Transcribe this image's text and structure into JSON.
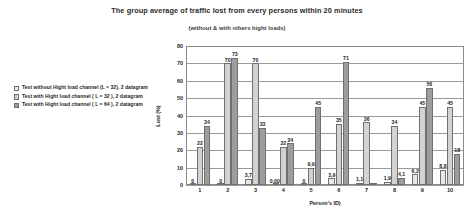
{
  "chart_data": {
    "type": "bar",
    "title": "The group average of traffic lost from every persons within 20 minutes",
    "subtitle": "(without & with others hight loads)",
    "xlabel": "Person's ID)",
    "ylabel": "Lost (%)",
    "ylim": [
      0,
      80
    ],
    "ytick_step": 10,
    "yticks": [
      0,
      10,
      20,
      30,
      40,
      50,
      60,
      70,
      80
    ],
    "grid": true,
    "legend_position": "left",
    "categories": [
      "1",
      "2",
      "3",
      "4",
      "5",
      "6",
      "7",
      "8",
      "9",
      "10"
    ],
    "series": [
      {
        "name": "Test without Hight load channel (L = 32), 2 datagram",
        "color": "#e8e8e8",
        "values": [
          0,
          0,
          3.7,
          0.001,
          0,
          3.9,
          1.1,
          1.9,
          6.2,
          8.8
        ],
        "labels": [
          "0",
          "0",
          "3,7",
          "0,001",
          "0",
          "3,9",
          "1,1",
          "1,9",
          "6,2",
          "8,8"
        ]
      },
      {
        "name": "Test with Hight load channel ( L = 32 ), 2 datagram",
        "color": "#d2d2d2",
        "values": [
          22,
          70,
          70,
          22,
          9.9,
          35,
          36,
          34,
          45,
          45
        ],
        "labels": [
          "22",
          "70",
          "70",
          "22",
          "9,9",
          "35",
          "36",
          "34",
          "45",
          "45"
        ]
      },
      {
        "name": "Test with Hight load channel ( L = 64 ), 2 datagram",
        "color": "#9d9d9d",
        "values": [
          34,
          73,
          33,
          24,
          45,
          71,
          0,
          4.1,
          56,
          18
        ],
        "labels": [
          "34",
          "73",
          "33",
          "24",
          "45",
          "71",
          "",
          "4,1",
          "56",
          "18"
        ]
      }
    ]
  }
}
